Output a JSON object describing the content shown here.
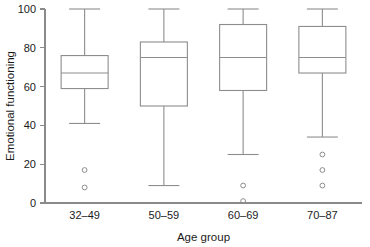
{
  "chart_data": {
    "type": "box",
    "title": "",
    "xlabel": "Age group",
    "ylabel": "Emotional functioning",
    "categories": [
      "32–49",
      "50–59",
      "60–69",
      "70–87"
    ],
    "ylim": [
      0,
      100
    ],
    "yticks": [
      0,
      20,
      40,
      60,
      80,
      100
    ],
    "ytick_labels": [
      "0",
      "20",
      "40",
      "60",
      "80",
      "100"
    ],
    "grid": false,
    "legend": false,
    "boxes": [
      {
        "category": "32–49",
        "whisker_low": 41,
        "q1": 59,
        "median": 67,
        "q3": 76,
        "whisker_high": 100,
        "outliers": [
          17,
          8
        ]
      },
      {
        "category": "50–59",
        "whisker_low": 9,
        "q1": 50,
        "median": 75,
        "q3": 83,
        "whisker_high": 100,
        "outliers": []
      },
      {
        "category": "60–69",
        "whisker_low": 25,
        "q1": 58,
        "median": 75,
        "q3": 92,
        "whisker_high": 100,
        "outliers": [
          9,
          1
        ]
      },
      {
        "category": "70–87",
        "whisker_low": 34,
        "q1": 67,
        "median": 75,
        "q3": 91,
        "whisker_high": 100,
        "outliers": [
          25,
          17,
          9
        ]
      }
    ],
    "colors": {
      "line": "#8d8d8d",
      "axis": "#8a8a8a",
      "text": "#1a1a1a",
      "background": "#ffffff"
    }
  }
}
